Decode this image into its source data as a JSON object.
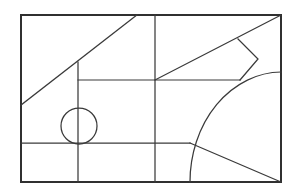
{
  "figure": {
    "background_color": "#ffffff",
    "line_color": "#3a3a3a",
    "frame_color": "#303030",
    "canvas": {
      "width": 295,
      "height": 196
    },
    "frame_rect": {
      "x": 21,
      "y": 15,
      "width": 260,
      "height": 167
    },
    "elements": [
      {
        "name": "outer-frame",
        "type": "rect",
        "x": 21,
        "y": 15,
        "width": 260,
        "height": 167
      },
      {
        "name": "upper-left-diagonal",
        "type": "line",
        "x1": 21,
        "y1": 105,
        "x2": 137,
        "y2": 15
      },
      {
        "name": "center-vertical-divider",
        "type": "line",
        "x1": 155,
        "y1": 15,
        "x2": 155,
        "y2": 182
      },
      {
        "name": "left-vertical-stem",
        "type": "line",
        "x1": 78,
        "y1": 62,
        "x2": 78,
        "y2": 182
      },
      {
        "name": "upper-horizontal-rail",
        "type": "line",
        "x1": 78,
        "y1": 80,
        "x2": 240,
        "y2": 80
      },
      {
        "name": "lower-horizontal-rail",
        "type": "line",
        "x1": 21,
        "y1": 143,
        "x2": 190,
        "y2": 143
      },
      {
        "name": "upper-right-diagonal",
        "type": "line",
        "x1": 155,
        "y1": 80,
        "x2": 281,
        "y2": 15
      },
      {
        "name": "notch-polyline",
        "type": "polyline",
        "points": "238,39 258,59 240,80"
      },
      {
        "name": "circle-node",
        "type": "circle",
        "cx": 79,
        "cy": 126,
        "r": 18
      },
      {
        "name": "quarter-arc",
        "type": "arc",
        "center_x": 282,
        "center_y": 182,
        "radius_x": 92,
        "radius_y": 110,
        "start_x": 190,
        "start_y": 182,
        "end_x": 281,
        "end_y": 72
      },
      {
        "name": "radial-line",
        "type": "line",
        "x1": 190,
        "y1": 143,
        "x2": 281,
        "y2": 182
      }
    ]
  }
}
